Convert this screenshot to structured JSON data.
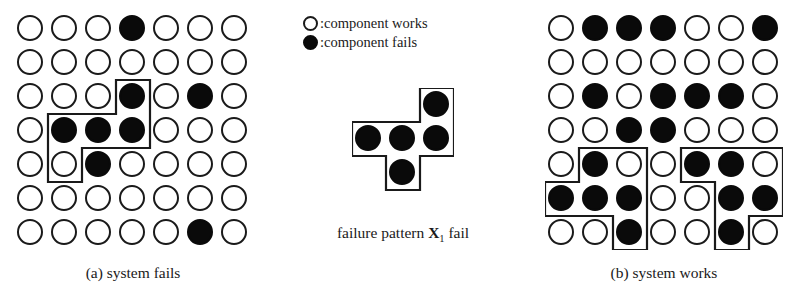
{
  "figure": {
    "colors": {
      "component_works_fill": "#ffffff",
      "component_fails_fill": "#0a0a0a",
      "stroke": "#1a1a1a",
      "background": "#ffffff"
    }
  },
  "legend": {
    "items": [
      {
        "symbol": "open-circle",
        "state": "works",
        "label": ":component works"
      },
      {
        "symbol": "filled-circle",
        "state": "fails",
        "label": ":component fails"
      }
    ]
  },
  "pattern": {
    "caption_prefix": "failure pattern ",
    "caption_symbol": "X",
    "caption_subscript": "1",
    "caption_suffix": " fail",
    "caption_full": "failure pattern X1 fail",
    "shape": "plus",
    "rows": 4,
    "cols": 3,
    "cells": [
      {
        "row": 1,
        "col": 3,
        "state": "fails"
      },
      {
        "row": 2,
        "col": 1,
        "state": "fails"
      },
      {
        "row": 2,
        "col": 2,
        "state": "fails"
      },
      {
        "row": 2,
        "col": 3,
        "state": "fails"
      },
      {
        "row": 3,
        "col": 2,
        "state": "fails"
      }
    ],
    "outline_points": "68,0 102,0 102,68 68,68 68,102 34,102 34,68 0,68 0,34 68,34"
  },
  "panels": [
    {
      "id": "a",
      "caption": "(a) system fails",
      "rows": 7,
      "cols": 7,
      "failed_cells": [
        [
          1,
          4
        ],
        [
          3,
          4
        ],
        [
          3,
          6
        ],
        [
          4,
          2
        ],
        [
          4,
          3
        ],
        [
          4,
          4
        ],
        [
          5,
          3
        ],
        [
          7,
          6
        ]
      ],
      "outlines": [
        {
          "name": "matched-failure-pattern-1",
          "points": "102,68 136,68 136,136 68,136 68,170 34,170 34,136 34,102 102,102"
        }
      ]
    },
    {
      "id": "b",
      "caption": "(b) system works",
      "rows": 7,
      "cols": 7,
      "failed_cells": [
        [
          1,
          2
        ],
        [
          1,
          3
        ],
        [
          1,
          4
        ],
        [
          1,
          7
        ],
        [
          3,
          2
        ],
        [
          3,
          4
        ],
        [
          3,
          5
        ],
        [
          3,
          6
        ],
        [
          4,
          3
        ],
        [
          4,
          4
        ],
        [
          5,
          2
        ],
        [
          5,
          5
        ],
        [
          5,
          6
        ],
        [
          6,
          1
        ],
        [
          6,
          2
        ],
        [
          6,
          3
        ],
        [
          6,
          6
        ],
        [
          6,
          7
        ],
        [
          7,
          3
        ],
        [
          7,
          6
        ]
      ],
      "outlines": [
        {
          "name": "partial-pattern-left",
          "points": "34,136 102,136 102,170 102,238 68,238 68,204 0,204 0,170 34,170"
        },
        {
          "name": "partial-pattern-right",
          "points": "136,136 238,136 238,204 204,204 204,238 170,238 170,170 136,170"
        }
      ]
    }
  ]
}
